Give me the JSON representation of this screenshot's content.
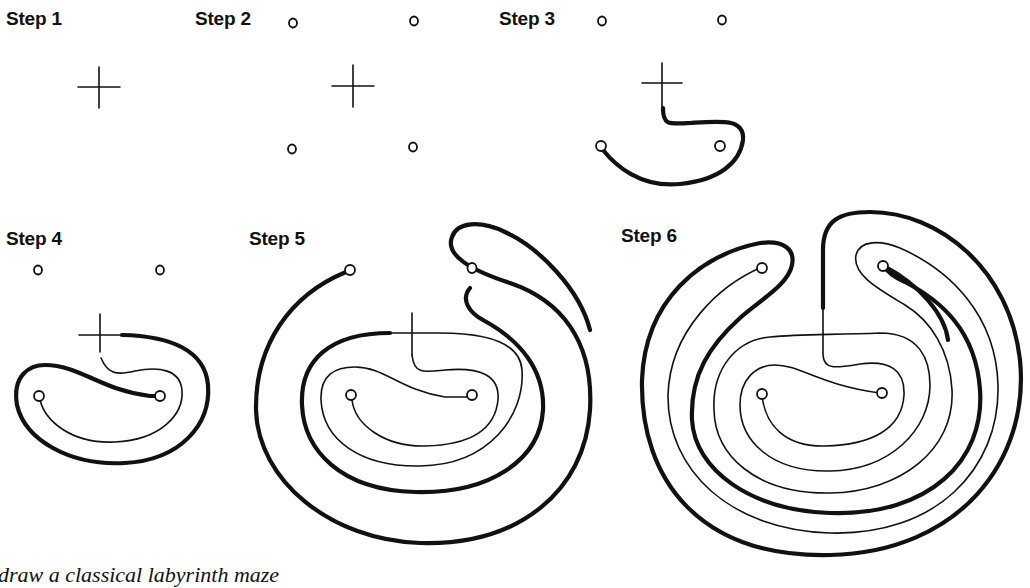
{
  "steps": [
    {
      "label": "Step 1",
      "description": "Draw a cross"
    },
    {
      "label": "Step 2",
      "description": "Add four dots at the corners"
    },
    {
      "label": "Step 3",
      "description": "Connect the cross arm to a dot with a curve"
    },
    {
      "label": "Step 4",
      "description": "Continue connecting lines and dots"
    },
    {
      "label": "Step 5",
      "description": "Add the next circuit"
    },
    {
      "label": "Step 6",
      "description": "Complete the classical labyrinth"
    }
  ],
  "caption": "draw a classical labyrinth maze",
  "colors": {
    "ink": "#111111",
    "background": "#ffffff"
  }
}
